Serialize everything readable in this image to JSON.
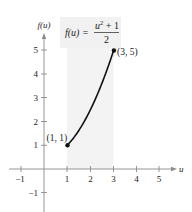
{
  "chart_data": {
    "type": "line",
    "title": "",
    "annotation_formula": {
      "lhs": "f(u) =",
      "numerator_base": "u",
      "numerator_exp": "2",
      "numerator_rest": " + 1",
      "denominator": "2",
      "text": "f(u) = (u^2 + 1)/2"
    },
    "xlabel": "u",
    "ylabel": "f(u)",
    "xlim": [
      -1.5,
      5.8
    ],
    "ylim": [
      -1.8,
      5.8
    ],
    "x_ticks": [
      -1,
      1,
      2,
      3,
      4,
      5
    ],
    "x_tick_labels": [
      "−1",
      "1",
      "2",
      "3",
      "4",
      "5"
    ],
    "y_ticks": [
      -1,
      1,
      2,
      3,
      4,
      5
    ],
    "y_tick_labels": [
      "−1",
      "1",
      "2",
      "3",
      "4",
      "5"
    ],
    "grid": false,
    "series": [
      {
        "name": "f(u) = (u^2+1)/2",
        "x": [
          1,
          1.5,
          2,
          2.5,
          3
        ],
        "y": [
          1,
          1.625,
          2.5,
          3.625,
          5
        ]
      }
    ],
    "points": [
      {
        "x": 1,
        "y": 1,
        "label": "(1, 1)"
      },
      {
        "x": 3,
        "y": 5,
        "label": "(3, 5)"
      }
    ],
    "shaded_region": {
      "x_from": 1,
      "x_to": 3,
      "color": "#f2f2f2"
    },
    "colors": {
      "curve": "#111111",
      "axis": "#888888",
      "shade": "#f2f2f2"
    }
  }
}
